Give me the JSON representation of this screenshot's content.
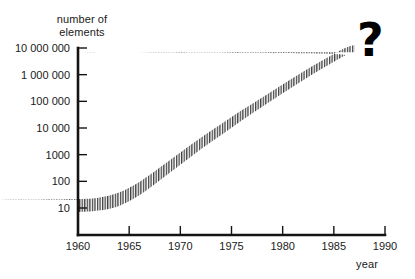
{
  "chart_data": {
    "type": "area",
    "title": "",
    "ylabel": "number of elements",
    "xlabel": "year",
    "yscale": "log",
    "ylim": [
      10,
      10000000
    ],
    "xlim": [
      1960,
      1990
    ],
    "grid": false,
    "legend": null,
    "annotations": [
      {
        "text": "?",
        "x": 1988,
        "y": 10000000
      }
    ],
    "y_tick_labels": [
      "10 000 000",
      "1 000 000",
      "100 000",
      "10 000",
      "1000",
      "100",
      "10"
    ],
    "y_tick_values": [
      10000000,
      1000000,
      100000,
      10000,
      1000,
      100,
      10
    ],
    "x_tick_labels": [
      "1960",
      "1965",
      "1970",
      "1975",
      "1980",
      "1985",
      "1990"
    ],
    "x_tick_values": [
      1960,
      1965,
      1970,
      1975,
      1980,
      1985,
      1990
    ],
    "series": [
      {
        "name": "number of elements per chip",
        "style": "hatched band",
        "x": [
          1960,
          1962,
          1964,
          1966,
          1968,
          1970,
          1972,
          1974,
          1976,
          1978,
          1980,
          1982,
          1984,
          1986,
          1987
        ],
        "lower": [
          7,
          8,
          12,
          30,
          110,
          420,
          1600,
          5500,
          19000,
          62000,
          200000,
          620000,
          1800000,
          5000000,
          7000000
        ],
        "upper": [
          20,
          24,
          38,
          95,
          330,
          1200,
          4300,
          14000,
          46000,
          140000,
          430000,
          1300000,
          3600000,
          9500000,
          13000000
        ]
      }
    ]
  },
  "labels": {
    "y_axis_title_line1": "number of",
    "y_axis_title_line2": "elements",
    "x_axis_title": "year",
    "question_mark": "?"
  },
  "colors": {
    "background": "#ffffff",
    "axis": "#141414",
    "text": "#1a1a1a",
    "band_hatch": "#4a4a4a",
    "annotation": "#000000"
  }
}
